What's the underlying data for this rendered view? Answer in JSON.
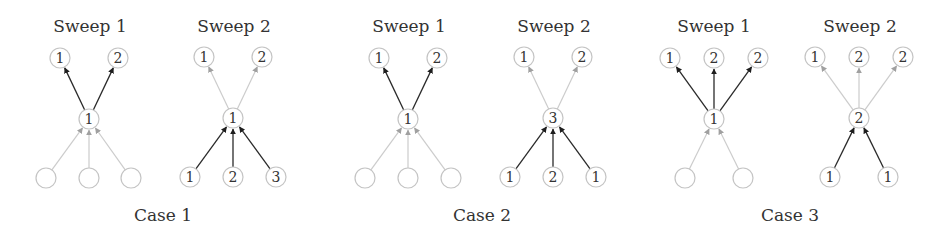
{
  "figure": {
    "cases": [
      {
        "label": "Case 1",
        "label_x": 163,
        "sweeps": [
          {
            "title": "Sweep 1",
            "title_x": 90,
            "center": {
              "x": 89,
              "y": 119,
              "value": "1"
            },
            "top": [
              {
                "x": 60,
                "y": 58,
                "value": "1"
              },
              {
                "x": 118,
                "y": 58,
                "value": "2"
              }
            ],
            "bottom": [
              {
                "x": 46,
                "y": 178,
                "value": ""
              },
              {
                "x": 89,
                "y": 178,
                "value": ""
              },
              {
                "x": 131,
                "y": 178,
                "value": ""
              }
            ],
            "up_edges_style": "dark",
            "in_edges_style": "light"
          },
          {
            "title": "Sweep 2",
            "title_x": 234,
            "center": {
              "x": 233,
              "y": 118,
              "value": "1"
            },
            "top": [
              {
                "x": 204,
                "y": 57,
                "value": "1"
              },
              {
                "x": 262,
                "y": 57,
                "value": "2"
              }
            ],
            "bottom": [
              {
                "x": 190,
                "y": 177,
                "value": "1"
              },
              {
                "x": 233,
                "y": 177,
                "value": "2"
              },
              {
                "x": 276,
                "y": 177,
                "value": "3"
              }
            ],
            "up_edges_style": "light",
            "in_edges_style": "dark"
          }
        ]
      },
      {
        "label": "Case 2",
        "label_x": 482,
        "sweeps": [
          {
            "title": "Sweep 1",
            "title_x": 409,
            "center": {
              "x": 408,
              "y": 119,
              "value": "1"
            },
            "top": [
              {
                "x": 379,
                "y": 58,
                "value": "1"
              },
              {
                "x": 437,
                "y": 58,
                "value": "2"
              }
            ],
            "bottom": [
              {
                "x": 365,
                "y": 178,
                "value": ""
              },
              {
                "x": 408,
                "y": 178,
                "value": ""
              },
              {
                "x": 451,
                "y": 178,
                "value": ""
              }
            ],
            "up_edges_style": "dark",
            "in_edges_style": "light"
          },
          {
            "title": "Sweep 2",
            "title_x": 554,
            "center": {
              "x": 553,
              "y": 118,
              "value": "3"
            },
            "top": [
              {
                "x": 524,
                "y": 57,
                "value": "1"
              },
              {
                "x": 582,
                "y": 57,
                "value": "2"
              }
            ],
            "bottom": [
              {
                "x": 510,
                "y": 177,
                "value": "1"
              },
              {
                "x": 553,
                "y": 177,
                "value": "2"
              },
              {
                "x": 596,
                "y": 177,
                "value": "1"
              }
            ],
            "up_edges_style": "light",
            "in_edges_style": "dark"
          }
        ]
      },
      {
        "label": "Case 3",
        "label_x": 790,
        "sweeps": [
          {
            "title": "Sweep 1",
            "title_x": 714,
            "center": {
              "x": 714,
              "y": 119,
              "value": "1"
            },
            "top": [
              {
                "x": 670,
                "y": 58,
                "value": "1"
              },
              {
                "x": 714,
                "y": 58,
                "value": "2"
              },
              {
                "x": 758,
                "y": 58,
                "value": "2"
              }
            ],
            "bottom": [
              {
                "x": 685,
                "y": 178,
                "value": ""
              },
              {
                "x": 743,
                "y": 178,
                "value": ""
              }
            ],
            "up_edges_style": "dark",
            "in_edges_style": "light"
          },
          {
            "title": "Sweep 2",
            "title_x": 860,
            "center": {
              "x": 859,
              "y": 118,
              "value": "2"
            },
            "top": [
              {
                "x": 815,
                "y": 57,
                "value": "1"
              },
              {
                "x": 859,
                "y": 57,
                "value": "2"
              },
              {
                "x": 903,
                "y": 57,
                "value": "2"
              }
            ],
            "bottom": [
              {
                "x": 830,
                "y": 177,
                "value": "1"
              },
              {
                "x": 888,
                "y": 177,
                "value": "1"
              }
            ],
            "up_edges_style": "light",
            "in_edges_style": "dark"
          }
        ]
      }
    ],
    "colors": {
      "dark_edge": "#2a2a2a",
      "light_edge": "#cccccc",
      "light_arrowhead": "#a0a0a0",
      "node_outline": "#c4c4c4",
      "text": "#333333"
    }
  }
}
